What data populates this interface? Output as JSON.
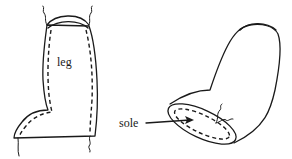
{
  "figure": {
    "panels": [
      {
        "id": "flat-piece",
        "description": "Flat boot pattern piece with dashed stitching line",
        "labels": [
          {
            "text": "leg"
          }
        ]
      },
      {
        "id": "assembled-boot",
        "description": "Assembled boot with sole stitched in, arrow pointing to sole",
        "labels": [
          {
            "text": "sole"
          }
        ]
      }
    ],
    "colors": {
      "ink": "#1a1a1a",
      "background": "#ffffff"
    }
  },
  "labels": {
    "leg": "leg",
    "sole": "sole"
  }
}
